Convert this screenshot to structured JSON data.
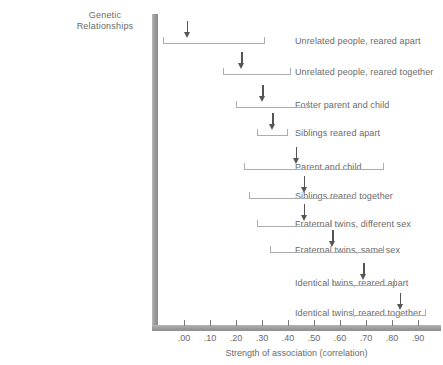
{
  "chart_data": {
    "type": "bar",
    "title": "Genetic Relationships",
    "xlabel": "Strength of association (correlation)",
    "ylabel": "",
    "xlim": [
      -0.1,
      1.0
    ],
    "grid": false,
    "legend": "none",
    "tick_labels": [
      ".00",
      ".10",
      ".20",
      ".30",
      ".40",
      ".50",
      ".60",
      ".70",
      ".80",
      ".90"
    ],
    "tick_values": [
      0.0,
      0.1,
      0.2,
      0.3,
      0.4,
      0.5,
      0.6,
      0.7,
      0.8,
      0.9
    ],
    "categories": [
      "Unrelated people, reared apart",
      "Unrelated people, reared together",
      "Foster parent and child",
      "Siblings reared apart",
      "Parent and child",
      "Siblings reared together",
      "Fraternal twins, different sex",
      "Fraternal twins, same sex",
      "Identical twins, reared apart",
      "Identical twins, reared together"
    ],
    "values": [
      0.01,
      0.22,
      0.3,
      0.34,
      0.43,
      0.46,
      0.46,
      0.57,
      0.69,
      0.83
    ],
    "range_low": [
      -0.08,
      0.15,
      0.2,
      0.28,
      0.23,
      0.25,
      0.28,
      0.33,
      0.57,
      0.65
    ],
    "range_high": [
      0.31,
      0.41,
      0.48,
      0.4,
      0.77,
      0.66,
      0.57,
      0.77,
      0.81,
      0.93
    ]
  },
  "header": {
    "title_line1": "Genetic",
    "title_line2": "Relationships"
  },
  "axis": {
    "x_title": "Strength of association (correlation)"
  },
  "rows": [
    {
      "label": "Unrelated people, reared apart",
      "value": 0.01,
      "low": -0.08,
      "high": 0.31,
      "label_y": 36,
      "track_y": 37
    },
    {
      "label": "Unrelated people, reared together",
      "value": 0.22,
      "low": 0.15,
      "high": 0.41,
      "label_y": 67,
      "track_y": 68
    },
    {
      "label": "Foster parent and child",
      "value": 0.3,
      "low": 0.2,
      "high": 0.48,
      "label_y": 100,
      "track_y": 101
    },
    {
      "label": "Siblings reared apart",
      "value": 0.34,
      "low": 0.28,
      "high": 0.4,
      "label_y": 128,
      "track_y": 129
    },
    {
      "label": "Parent and child",
      "value": 0.43,
      "low": 0.23,
      "high": 0.77,
      "label_y": 162,
      "track_y": 163
    },
    {
      "label": "Siblings reared together",
      "value": 0.46,
      "low": 0.25,
      "high": 0.66,
      "label_y": 191,
      "track_y": 192
    },
    {
      "label": "Fraternal twins, different sex",
      "value": 0.46,
      "low": 0.28,
      "high": 0.57,
      "label_y": 219,
      "track_y": 220
    },
    {
      "label": "Fraternal twins, same sex",
      "value": 0.57,
      "low": 0.33,
      "high": 0.77,
      "label_y": 245,
      "track_y": 246
    },
    {
      "label": "Identical twins, reared apart",
      "value": 0.69,
      "low": 0.57,
      "high": 0.81,
      "label_y": 278,
      "track_y": 279
    },
    {
      "label": "Identical twins, reared together",
      "value": 0.83,
      "low": 0.65,
      "high": 0.93,
      "label_y": 308,
      "track_y": 309
    }
  ],
  "colors": {
    "axis": "#9a9a9a",
    "bracket": "#adadad",
    "arrow": "#555555",
    "text": "#6a6a6a",
    "background": "#ffffff"
  }
}
